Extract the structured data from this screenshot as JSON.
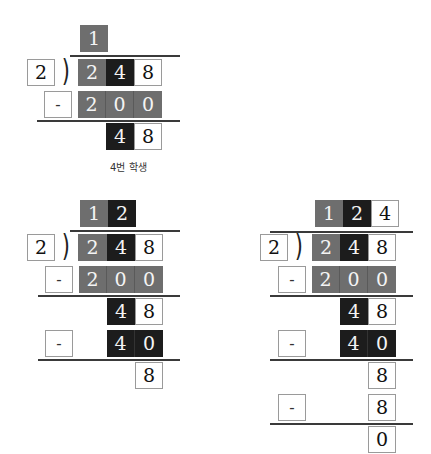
{
  "caption": "4번 학생",
  "colors": {
    "gray": "#6e6e6e",
    "dark": "#1c1c1c",
    "white": "#ffffff",
    "line": "#3a3a3a"
  },
  "blocks": [
    {
      "divisor": "2",
      "quotient": [
        "1"
      ],
      "dividend": [
        "2",
        "4",
        "8"
      ],
      "steps": [
        {
          "sign": "-",
          "subtrahend": [
            "2",
            "0",
            "0"
          ],
          "remainder": [
            "4",
            "8"
          ]
        }
      ]
    },
    {
      "divisor": "2",
      "quotient": [
        "1",
        "2"
      ],
      "dividend": [
        "2",
        "4",
        "8"
      ],
      "steps": [
        {
          "sign": "-",
          "subtrahend": [
            "2",
            "0",
            "0"
          ],
          "remainder": [
            "4",
            "8"
          ]
        },
        {
          "sign": "-",
          "subtrahend": [
            "4",
            "0"
          ],
          "remainder": [
            "8"
          ]
        }
      ]
    },
    {
      "divisor": "2",
      "quotient": [
        "1",
        "2",
        "4"
      ],
      "dividend": [
        "2",
        "4",
        "8"
      ],
      "steps": [
        {
          "sign": "-",
          "subtrahend": [
            "2",
            "0",
            "0"
          ],
          "remainder": [
            "4",
            "8"
          ]
        },
        {
          "sign": "-",
          "subtrahend": [
            "4",
            "0"
          ],
          "remainder": [
            "8"
          ]
        },
        {
          "sign": "-",
          "subtrahend": [
            "8"
          ],
          "remainder": [
            "0"
          ]
        }
      ]
    }
  ]
}
